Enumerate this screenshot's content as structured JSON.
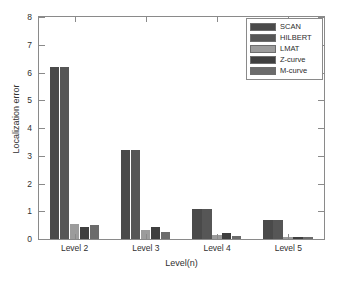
{
  "chart_data": {
    "type": "bar",
    "title": "",
    "xlabel": "Level(n)",
    "ylabel": "Localization error",
    "categories": [
      "Level 2",
      "Level 3",
      "Level 4",
      "Level 5"
    ],
    "ylim": [
      0,
      8
    ],
    "yticks": [
      0,
      1,
      2,
      3,
      4,
      5,
      6,
      7,
      8
    ],
    "ytick_labels": [
      "0",
      "1",
      "2",
      "3",
      "4",
      "5",
      "6",
      "7",
      "8"
    ],
    "grid": false,
    "legend_position": "top-right",
    "series": [
      {
        "name": "SCAN",
        "color": "#4a4a4a",
        "values": [
          6.2,
          3.22,
          1.07,
          0.68
        ]
      },
      {
        "name": "HILBERT",
        "color": "#565656",
        "values": [
          6.2,
          3.22,
          1.07,
          0.68
        ]
      },
      {
        "name": "LMAT",
        "color": "#9c9c9c",
        "values": [
          0.55,
          0.31,
          0.14,
          0.03
        ]
      },
      {
        "name": "Z-curve",
        "color": "#3f3f3f",
        "values": [
          0.45,
          0.42,
          0.2,
          0.03
        ]
      },
      {
        "name": "M-curve",
        "color": "#6b6b6b",
        "values": [
          0.52,
          0.26,
          0.12,
          0.02
        ]
      }
    ]
  }
}
